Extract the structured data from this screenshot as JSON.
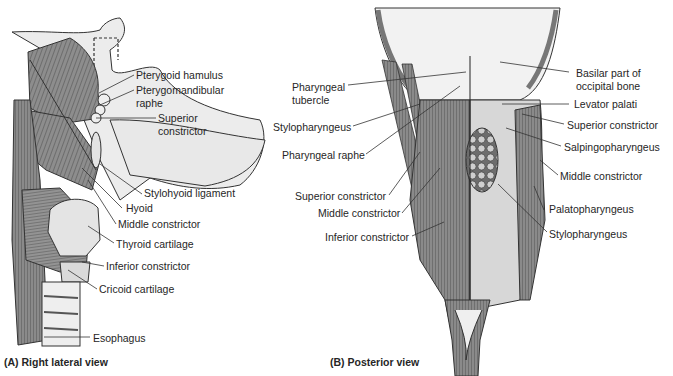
{
  "panel_a": {
    "caption": "(A) Right lateral view",
    "labels": [
      "Pterygoid hamulus",
      "Pterygomandibular",
      "raphe",
      "Superior",
      "constrictor",
      "Stylohyoid ligament",
      "Hyoid",
      "Middle constrictor",
      "Thyroid cartilage",
      "Inferior constrictor",
      "Cricoid cartilage",
      "Esophagus"
    ]
  },
  "panel_b": {
    "caption": "(B) Posterior view",
    "labels_left": [
      "Pharyngeal",
      "tubercle",
      "Stylopharyngeus",
      "Pharyngeal raphe",
      "Superior constrictor",
      "Middle constrictor",
      "Inferior constrictor"
    ],
    "labels_right": [
      "Basilar part of",
      "occipital bone",
      "Levator palati",
      "Superior constrictor",
      "Salpingopharyngeus",
      "Middle constrictor",
      "Palatopharyngeus",
      "Stylopharyngeus"
    ]
  },
  "colors": {
    "muscle": "#8a8a8a",
    "muscle_dark": "#5e5e5e",
    "bone": "#e6e6e6",
    "outline": "#333333"
  }
}
